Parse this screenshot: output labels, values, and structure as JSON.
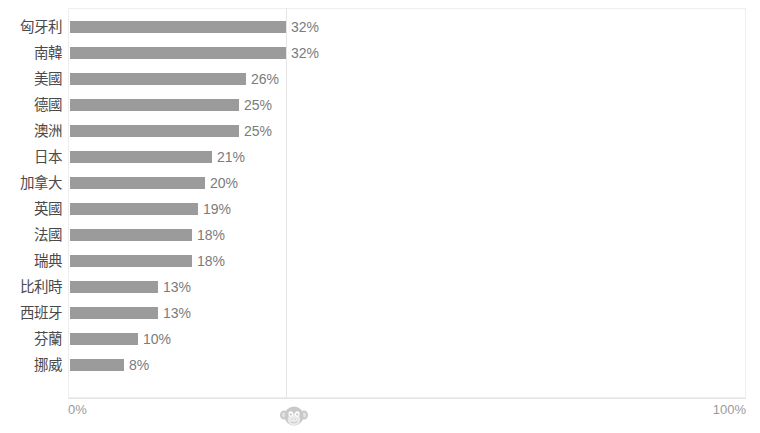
{
  "chart_data": {
    "type": "bar",
    "orientation": "horizontal",
    "title": "",
    "xlabel": "",
    "ylabel": "",
    "xlim": [
      0,
      100
    ],
    "grid": false,
    "legend": "none",
    "value_suffix": "%",
    "categories": [
      "匈牙利",
      "南韓",
      "美國",
      "德國",
      "澳洲",
      "日本",
      "加拿大",
      "英國",
      "法國",
      "瑞典",
      "比利時",
      "西班牙",
      "芬蘭",
      "挪威"
    ],
    "values": [
      32,
      32,
      26,
      25,
      25,
      21,
      20,
      19,
      18,
      18,
      13,
      13,
      10,
      8
    ],
    "data_labels": [
      "32%",
      "32%",
      "26%",
      "25%",
      "25%",
      "21%",
      "20%",
      "19%",
      "18%",
      "18%",
      "13%",
      "13%",
      "10%",
      "8%"
    ],
    "series": [
      {
        "name": "",
        "color": "#9b9b9b",
        "values": [
          32,
          32,
          26,
          25,
          25,
          21,
          20,
          19,
          18,
          18,
          13,
          13,
          10,
          8
        ]
      }
    ]
  },
  "axis": {
    "ticks": [
      "0%",
      "100%"
    ],
    "tick_left": "0%",
    "tick_right": "100%"
  },
  "header": {
    "cropped_title": " "
  },
  "watermark": {
    "name": "monkey-logo",
    "color": "#9e9e9e"
  },
  "colors": {
    "bar": "#9b9b9b",
    "label_text": "#4a4a4a",
    "value_text": "#7b7b7b",
    "axis_text": "#9a9a9a",
    "frame": "#eeeeee",
    "gridline": "#e6e6e6",
    "background": "#ffffff"
  }
}
